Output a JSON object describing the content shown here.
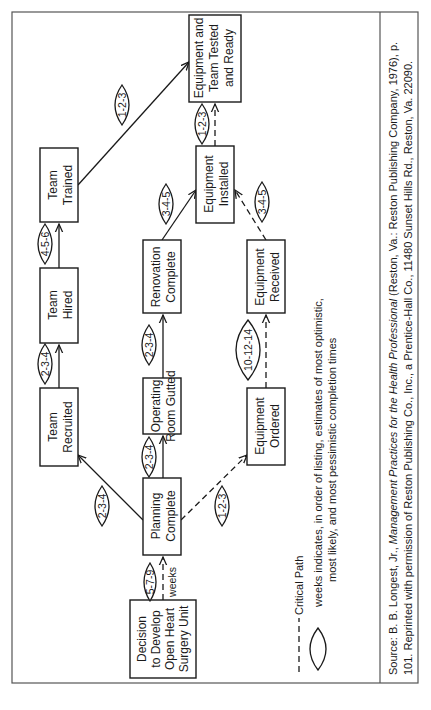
{
  "document": {
    "orientation": "rotated-90-ccw",
    "nodes": {
      "decision": [
        "Decision",
        "to Develop",
        "Open Heart",
        "Surgery Unit"
      ],
      "planning": [
        "Planning",
        "Complete"
      ],
      "team_recruited": [
        "Team",
        "Recruited"
      ],
      "team_hired": [
        "Team",
        "Hired"
      ],
      "team_trained": [
        "Team",
        "Trained"
      ],
      "or_gutted": [
        "Operating",
        "Room Gutted"
      ],
      "renovation": [
        "Renovation",
        "Complete"
      ],
      "equip_ordered": [
        "Equipment",
        "Ordered"
      ],
      "equip_received": [
        "Equipment",
        "Received"
      ],
      "equip_installed": [
        "Equipment",
        "Installed"
      ],
      "ready": [
        "Equipment and",
        "Team Tested",
        "and Ready"
      ]
    },
    "estimates": {
      "decision_planning": "5-7-9",
      "weeks_label": "weeks",
      "planning_recruited": "2-3-4",
      "recruited_hired": "2-3-4",
      "hired_trained": "4-5-6",
      "trained_ready": "1-2-3",
      "planning_gutted": "2-3-4",
      "gutted_renovation": "2-3-4",
      "renovation_installed": "3-4-5",
      "planning_ordered": "1-2-3",
      "ordered_received": "10-12-14",
      "received_installed": "3-4-5",
      "installed_ready": "1-2-3"
    },
    "legend": {
      "critical_path": "Critical Path",
      "lens_line1": "weeks indicates, in order of listing, estimates of most optimistic,",
      "lens_line2": "most likely, and most pessimistic completion times"
    },
    "source": {
      "prefix": "Source: B. B. Longest, Jr., ",
      "title": "Management Practices for the Health Professional",
      "suffix": " (Reston, Va.: Reston Publishing Company, 1976), p.",
      "line2": "101. Reprinted with permission of Reston Publishing Co., Inc., a Prentice-Hall Co., 11480 Sunset Hills Rd., Reston, Va. 22090."
    }
  }
}
